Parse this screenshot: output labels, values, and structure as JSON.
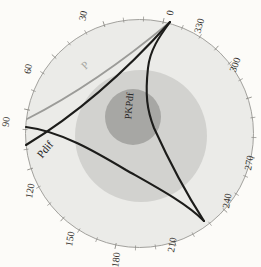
{
  "figure": {
    "background": "#fcfbf8",
    "center": {
      "x": 139.5,
      "y": 133.5
    },
    "radius": 114,
    "outline_color": "#a2a19d",
    "tick_color": "#8b8a85",
    "tick_step_deg": 10,
    "tick_rotation_offset_deg": 12,
    "label_color": "#34322e",
    "tick_labels": [
      {
        "text": "0",
        "x": 171,
        "y": 13,
        "rot": -78
      },
      {
        "text": "330",
        "x": 200,
        "y": 26,
        "rot": -74
      },
      {
        "text": "300",
        "x": 236,
        "y": 65,
        "rot": -70
      },
      {
        "text": "270",
        "x": 250,
        "y": 163,
        "rot": -80
      },
      {
        "text": "240",
        "x": 228,
        "y": 201,
        "rot": -80
      },
      {
        "text": "210",
        "x": 173,
        "y": 245,
        "rot": -80
      },
      {
        "text": "180",
        "x": 117,
        "y": 260,
        "rot": -82
      },
      {
        "text": "150",
        "x": 71,
        "y": 239,
        "rot": -80
      },
      {
        "text": "120",
        "x": 31,
        "y": 191,
        "rot": -80
      },
      {
        "text": "90",
        "x": 7,
        "y": 122,
        "rot": -82
      },
      {
        "text": "60",
        "x": 29,
        "y": 69,
        "rot": -80
      },
      {
        "text": "30",
        "x": 84,
        "y": 16,
        "rot": -78
      }
    ],
    "shells": [
      {
        "name": "outer-disc",
        "cx": 139.5,
        "cy": 133.5,
        "r": 114,
        "fill": "#ebebe8",
        "stroke": "#a2a19d"
      },
      {
        "name": "middle-disc",
        "cx": 141,
        "cy": 136,
        "r": 66,
        "fill": "#d2d2cf",
        "stroke": "none"
      },
      {
        "name": "inner-disc",
        "cx": 133,
        "cy": 117,
        "r": 28,
        "fill": "#a7a7a4",
        "stroke": "none"
      }
    ],
    "rays": [
      {
        "name": "ray-P",
        "color": "#9b9b98",
        "width": 1.7,
        "path": "M 170 22 Q 96 84 27 119",
        "label": {
          "text": "P",
          "x": 86,
          "y": 66,
          "rot": -44,
          "color": "#a6a6a2",
          "size": 11
        }
      },
      {
        "name": "ray-Pdif",
        "color": "#1c1c1a",
        "width": 2.1,
        "path": "M 170 22 Q 99 101 26 145",
        "label": {
          "text": "Pdif",
          "x": 46,
          "y": 150,
          "rot": -50,
          "color": "#22201d",
          "size": 11
        }
      },
      {
        "name": "ray-PKPdf",
        "color": "#1c1c1a",
        "width": 2.1,
        "path": "M 170 22 C 159 37 150 50 148 68 C 145 95 147 110 154 128 C 164 150 184 190 204 221",
        "label": {
          "text": "PKPdf",
          "x": 130,
          "y": 106,
          "rot": -85,
          "color": "#22201d",
          "size": 10
        }
      },
      {
        "name": "ray-surface-leg",
        "color": "#1c1c1a",
        "width": 2.1,
        "path": "M 26 127 C 60 131 96 152 126 170 C 156 187 186 203 204 221",
        "label": null
      }
    ]
  },
  "chart_data": {
    "type": "line",
    "projection": "polar",
    "angular_unit": "degrees",
    "angular_direction": "counterclockwise-from-top",
    "angular_tick_labels": [
      0,
      30,
      60,
      90,
      120,
      150,
      180,
      210,
      240,
      270,
      300,
      330
    ],
    "minor_tick_step_deg": 10,
    "grid": false,
    "legend": "none",
    "series": [
      {
        "name": "P",
        "kind": "ray-path",
        "color": "gray",
        "from_deg": 0,
        "to_deg": 93
      },
      {
        "name": "Pdif",
        "kind": "ray-path",
        "color": "black",
        "from_deg": 0,
        "to_deg": 100
      },
      {
        "name": "PKPdf",
        "kind": "ray-path-through-inner-disc",
        "color": "black",
        "from_deg": 0,
        "to_deg": 215
      },
      {
        "name": "surface-leg",
        "kind": "ray-path",
        "color": "black",
        "from_deg": 95,
        "to_deg": 215
      }
    ],
    "shaded_rings": [
      {
        "name": "outer-disc",
        "fill": "#ebebe8"
      },
      {
        "name": "middle-disc",
        "fill": "#d2d2cf"
      },
      {
        "name": "inner-disc",
        "fill": "#a7a7a4"
      }
    ],
    "annotations": [
      "P",
      "Pdif",
      "PKPdf"
    ]
  }
}
